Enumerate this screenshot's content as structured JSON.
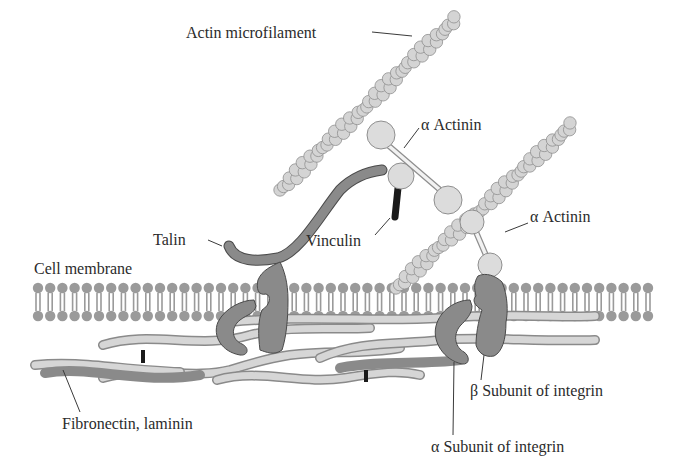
{
  "figure": {
    "type": "cell adhesion schematic",
    "colors": {
      "background": "#ffffff",
      "actin_bead": "#d4d4d4",
      "membrane_lipid": "#9a9a9a",
      "integrin": "#8a8a8a",
      "talin": "#808080",
      "vinculin_stalk": "#1a1a1a",
      "ecm_fiber": "#d6d6d6",
      "label_text": "#2b2b2b"
    }
  },
  "labels": {
    "actin_microfilament": "Actin microfilament",
    "alpha_actinin_1": "α Actinin",
    "alpha_actinin_2": "α Actinin",
    "talin": "Talin",
    "vinculin": "Vinculin",
    "cell_membrane": "Cell membrane",
    "fibronectin_laminin": "Fibronectin, laminin",
    "beta_subunit": "β Subunit of integrin",
    "alpha_subunit": "α Subunit of integrin"
  }
}
